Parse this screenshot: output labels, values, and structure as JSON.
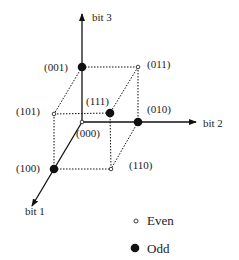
{
  "diagram": {
    "title": "",
    "axes": {
      "bit1": "bit 1",
      "bit2": "bit 2",
      "bit3": "bit 3"
    },
    "vertices": [
      {
        "label": "(000)",
        "parity": "even"
      },
      {
        "label": "(001)",
        "parity": "odd"
      },
      {
        "label": "(010)",
        "parity": "odd"
      },
      {
        "label": "(011)",
        "parity": "even"
      },
      {
        "label": "(100)",
        "parity": "odd"
      },
      {
        "label": "(101)",
        "parity": "even"
      },
      {
        "label": "(110)",
        "parity": "even"
      },
      {
        "label": "(111)",
        "parity": "odd"
      }
    ],
    "legend": {
      "even": "Even",
      "odd": "Odd"
    },
    "colors": {
      "stroke": "#111111",
      "background": "#ffffff"
    }
  }
}
